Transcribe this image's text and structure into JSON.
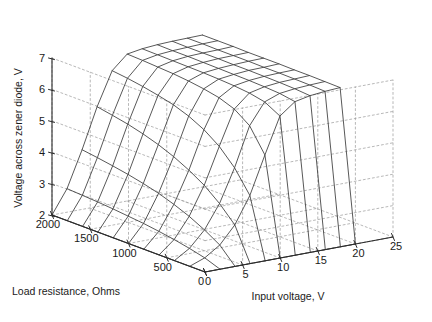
{
  "figure": {
    "background": "#ffffff",
    "line_color": "#3a3a3a",
    "grid_color": "#9a9a9a",
    "axis_color": "#2b2b2b",
    "text_color": "#1a1a1a"
  },
  "chart_data": {
    "type": "line",
    "title": "",
    "projection": "3d-mesh",
    "grid": true,
    "legend": null,
    "xlabel": "Input voltage, V",
    "ylabel": "Load resistance, Ohms",
    "zlabel": "Voltage across zener diode, V",
    "xticks": [
      "0",
      "5",
      "10",
      "15",
      "20",
      "25"
    ],
    "xtick_values": [
      0,
      5,
      10,
      15,
      20,
      25
    ],
    "yticks": [
      "2000",
      "1500",
      "1000",
      "500",
      "0"
    ],
    "ytick_values": [
      2000,
      1500,
      1000,
      500,
      0
    ],
    "zticks": [
      "2",
      "3",
      "4",
      "5",
      "6",
      "7"
    ],
    "ztick_values": [
      2,
      3,
      4,
      5,
      6,
      7
    ],
    "xlim": [
      0,
      25
    ],
    "ylim": [
      0,
      2000
    ],
    "zlim": [
      2,
      7
    ],
    "x": [
      0,
      2,
      4,
      6,
      8,
      10,
      12,
      14,
      16,
      18,
      20
    ],
    "y": [
      0,
      200,
      400,
      600,
      800,
      1000,
      1200,
      1400,
      1600,
      1800,
      2000
    ],
    "series": [
      {
        "name": "R = 0",
        "values": [
          2.0,
          2.0,
          2.0,
          2.0,
          2.0,
          2.0,
          2.0,
          2.0,
          2.0,
          2.0,
          2.0
        ]
      },
      {
        "name": "R = 200",
        "values": [
          2.0,
          2.18,
          2.5,
          3.05,
          3.9,
          5.1,
          6.25,
          6.62,
          6.72,
          6.77,
          6.8
        ]
      },
      {
        "name": "R = 400",
        "values": [
          2.0,
          2.3,
          2.8,
          3.55,
          4.6,
          5.85,
          6.52,
          6.7,
          6.76,
          6.79,
          6.81
        ]
      },
      {
        "name": "R = 600",
        "values": [
          2.0,
          2.4,
          3.05,
          3.95,
          5.1,
          6.2,
          6.62,
          6.73,
          6.78,
          6.8,
          6.82
        ]
      },
      {
        "name": "R = 800",
        "values": [
          2.0,
          2.48,
          3.25,
          4.25,
          5.45,
          6.38,
          6.67,
          6.75,
          6.79,
          6.81,
          6.82
        ]
      },
      {
        "name": "R = 1000",
        "values": [
          2.0,
          2.55,
          3.42,
          4.5,
          5.7,
          6.48,
          6.7,
          6.76,
          6.8,
          6.81,
          6.83
        ]
      },
      {
        "name": "R = 1200",
        "values": [
          2.0,
          2.6,
          3.55,
          4.7,
          5.88,
          6.55,
          6.72,
          6.77,
          6.8,
          6.82,
          6.83
        ]
      },
      {
        "name": "R = 1400",
        "values": [
          2.0,
          2.65,
          3.66,
          4.86,
          6.0,
          6.6,
          6.73,
          6.78,
          6.81,
          6.82,
          6.83
        ]
      },
      {
        "name": "R = 1600",
        "values": [
          2.0,
          2.69,
          3.75,
          4.99,
          6.1,
          6.63,
          6.74,
          6.79,
          6.81,
          6.82,
          6.84
        ]
      },
      {
        "name": "R = 1800",
        "values": [
          2.0,
          2.72,
          3.83,
          5.09,
          6.18,
          6.66,
          6.75,
          6.79,
          6.81,
          6.83,
          6.84
        ]
      },
      {
        "name": "R = 2000",
        "values": [
          2.0,
          2.75,
          3.9,
          5.18,
          6.24,
          6.68,
          6.76,
          6.8,
          6.82,
          6.83,
          6.84
        ]
      }
    ]
  }
}
